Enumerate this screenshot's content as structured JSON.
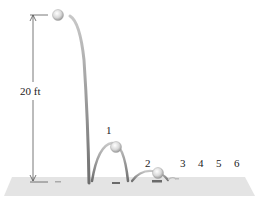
{
  "diagram": {
    "height_label": "20 ft",
    "bounce_labels": [
      "1",
      "2",
      "3",
      "4",
      "5",
      "6"
    ],
    "colors": {
      "floor": "#e4e4e4",
      "path": "#8f8f8f",
      "ball": "#d8d8d8",
      "shadow": "#6a6a6a",
      "dimension_line": "#555555"
    }
  }
}
